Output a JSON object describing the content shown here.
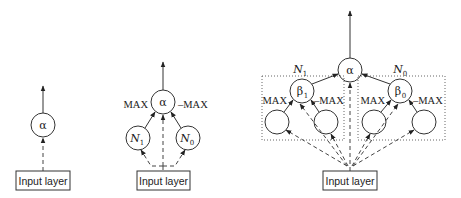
{
  "figure": {
    "diagrams": [
      {
        "id": "single-node",
        "output_node": "α",
        "input_label": "Input layer"
      },
      {
        "id": "two-network-combination",
        "output_node": "α",
        "left_weight": "MAX",
        "right_weight": "–MAX",
        "left_child": {
          "base": "N",
          "sub": "1"
        },
        "right_child": {
          "base": "N",
          "sub": "0"
        },
        "input_label": "Input layer"
      },
      {
        "id": "hierarchical-combination",
        "output_node": "α",
        "left_group": {
          "title": {
            "base": "N",
            "sub": "1"
          },
          "node": {
            "base": "β",
            "sub": "1"
          },
          "left_weight": "MAX",
          "right_weight": "–MAX"
        },
        "right_group": {
          "title": {
            "base": "N",
            "sub": "0"
          },
          "node": {
            "base": "β",
            "sub": "0"
          },
          "left_weight": "MAX",
          "right_weight": "–MAX"
        },
        "input_label": "Input layer"
      }
    ],
    "colors": {
      "stroke": "#333333",
      "dotted_box": "#666666",
      "background": "#ffffff"
    }
  }
}
